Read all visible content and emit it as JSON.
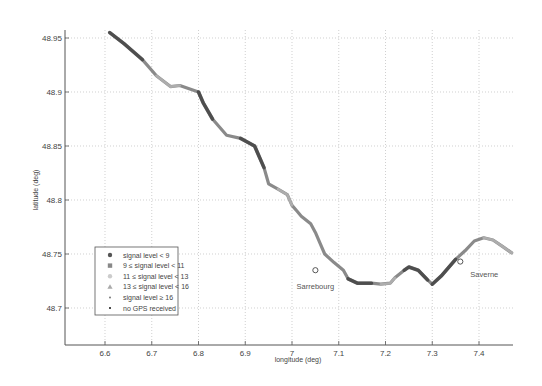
{
  "chart_data": {
    "type": "scatter",
    "title": "",
    "xlabel": "longitude (deg)",
    "ylabel": "latitude (deg)",
    "xlim": [
      6.52,
      7.48
    ],
    "ylim": [
      48.635,
      48.975
    ],
    "xticks": [
      6.6,
      6.7,
      6.8,
      6.9,
      7.0,
      7.1,
      7.2,
      7.3,
      7.4
    ],
    "xtick_labels": [
      "6.6",
      "6.7",
      "6.8",
      "6.9",
      "7",
      "7.1",
      "7.2",
      "7.3",
      "7.4"
    ],
    "yticks": [
      48.7,
      48.75,
      48.8,
      48.85,
      48.9,
      48.95
    ],
    "ytick_labels": [
      "48.7",
      "48.75",
      "48.8",
      "48.85",
      "48.9",
      "48.95"
    ],
    "grid": true,
    "legend_position": "lower left",
    "legend": [
      {
        "label": "signal level < 9",
        "marker": "circle",
        "color": "#555555"
      },
      {
        "label": "9 ≤ signal level < 11",
        "marker": "square",
        "color": "#888888"
      },
      {
        "label": "11 ≤ signal level < 13",
        "marker": "circle",
        "color": "#cccccc"
      },
      {
        "label": "13 ≤ signal level < 16",
        "marker": "triangle",
        "color": "#aaaaaa"
      },
      {
        "label": "signal level ≥ 16",
        "marker": "dot",
        "color": "#777777"
      },
      {
        "label": "no GPS received",
        "marker": "dot",
        "color": "#111111"
      }
    ],
    "annotations": [
      {
        "label": "Sarrebourg",
        "lon": 7.05,
        "lat": 48.735
      },
      {
        "label": "Saverne",
        "lon": 7.36,
        "lat": 48.743
      }
    ],
    "route": {
      "lon": [
        6.61,
        6.64,
        6.68,
        6.71,
        6.74,
        6.76,
        6.8,
        6.81,
        6.83,
        6.86,
        6.89,
        6.92,
        6.94,
        6.95,
        6.97,
        6.99,
        7.0,
        7.01,
        7.02,
        7.04,
        7.05,
        7.06,
        7.07,
        7.09,
        7.11,
        7.12,
        7.14,
        7.17,
        7.19,
        7.21,
        7.22,
        7.24,
        7.25,
        7.27,
        7.29,
        7.3,
        7.32,
        7.35,
        7.37,
        7.39,
        7.41,
        7.43,
        7.45,
        7.47
      ],
      "lat": [
        48.955,
        48.945,
        48.93,
        48.915,
        48.905,
        48.906,
        48.9,
        48.89,
        48.875,
        48.86,
        48.857,
        48.85,
        48.83,
        48.815,
        48.81,
        48.805,
        48.795,
        48.79,
        48.785,
        48.778,
        48.77,
        48.76,
        48.75,
        48.742,
        48.735,
        48.727,
        48.723,
        48.723,
        48.722,
        48.723,
        48.728,
        48.735,
        48.738,
        48.735,
        48.726,
        48.722,
        48.73,
        48.745,
        48.753,
        48.762,
        48.765,
        48.763,
        48.757,
        48.751
      ]
    }
  }
}
